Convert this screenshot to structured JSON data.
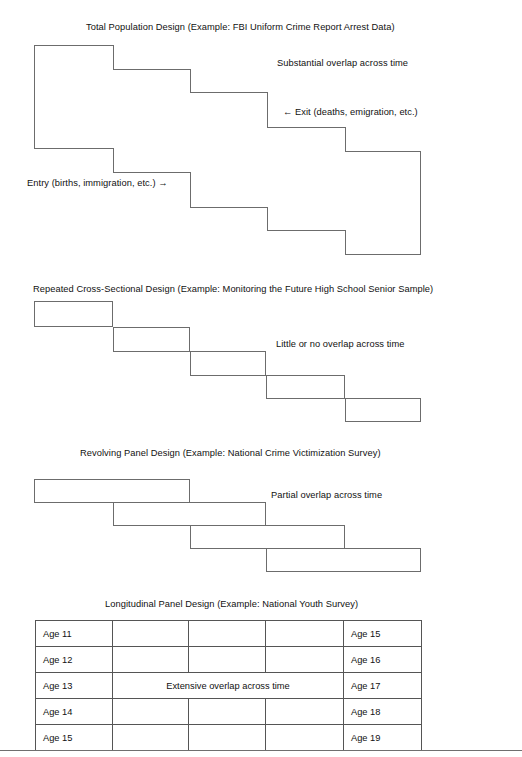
{
  "document": {
    "title": "Research Design Comparison Figure",
    "background_color": "#ffffff",
    "line_color": "#6c6c6c",
    "text_color": "#111111"
  },
  "panels": [
    {
      "id": "total-population",
      "caption": "Total Population Design (Example:  FBI Uniform Crime Report Arrest Data)",
      "overlap_note": "Substantial overlap across time",
      "exit_label": "←   Exit (deaths, emigration, etc.)",
      "entry_label": "Entry  (births, immigration, etc.)  →",
      "shape_type": "staircase-outline"
    },
    {
      "id": "repeated-cross-sectional",
      "caption": "Repeated Cross-Sectional Design (Example:  Monitoring the Future High School Senior Sample)",
      "overlap_note": "Little or no overlap across time",
      "shape_type": "stepped-rectangles",
      "box_count": 5
    },
    {
      "id": "revolving-panel",
      "caption": "Revolving Panel Design (Example:  National Crime Victimization Survey)",
      "overlap_note": "Partial overlap across time",
      "shape_type": "overlapping-rectangles",
      "box_count": 4
    },
    {
      "id": "longitudinal-panel",
      "caption": "Longitudinal Panel Design (Example:  National Youth Survey)",
      "overlap_note": "Extensive overlap across time",
      "shape_type": "table",
      "table": {
        "rows": [
          {
            "first": "Age 11",
            "last": "Age 15"
          },
          {
            "first": "Age 12",
            "last": "Age 16"
          },
          {
            "first": "Age 13",
            "last": "Age 17",
            "merged_center": "Extensive overlap across time"
          },
          {
            "first": "Age 14",
            "last": "Age 18"
          },
          {
            "first": "Age 15",
            "last": "Age 19"
          }
        ]
      }
    }
  ]
}
